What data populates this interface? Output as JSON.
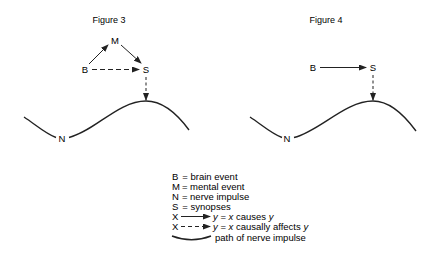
{
  "figure3": {
    "title": "Figure 3",
    "labels": {
      "B": "B",
      "M": "M",
      "S": "S",
      "N": "N"
    }
  },
  "figure4": {
    "title": "Figure 4",
    "labels": {
      "B": "B",
      "S": "S",
      "N": "N"
    }
  },
  "legend": {
    "items": [
      {
        "symbol": "B",
        "text": "=  brain event"
      },
      {
        "symbol": "M",
        "text": "=  mental event"
      },
      {
        "symbol": "N",
        "text": "=  nerve impulse"
      },
      {
        "symbol": "S",
        "text": "=  synopses"
      },
      {
        "symbol": "X",
        "text_pre": "y",
        "text_mid": " = ",
        "text_x": "x",
        "text_post": " causes ",
        "text_y": "y"
      },
      {
        "symbol": "X",
        "text_pre": "y",
        "text_mid": " = ",
        "text_x": "x",
        "text_post": " causally affects ",
        "text_y": "y"
      },
      {
        "text": "path of nerve impulse"
      }
    ]
  },
  "colors": {
    "ink": "#222222",
    "background": "#ffffff"
  }
}
